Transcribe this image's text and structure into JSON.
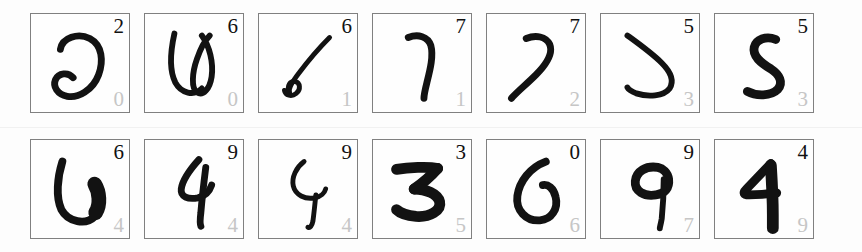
{
  "view": {
    "title": "Handwritten Digit Prediction Grid",
    "background_color": "#fdfdfd",
    "cell_border_color": "#808080",
    "predicted_label_color": "#111111",
    "true_label_color": "#c6c6c6",
    "stroke_color": "#121212",
    "rows": 2,
    "columns": 7,
    "cell_count": 14
  },
  "cells": [
    {
      "index": 0,
      "row": 1,
      "column": 1,
      "predicted": "2",
      "actual": "0",
      "shape": "two-open-loop"
    },
    {
      "index": 1,
      "row": 1,
      "column": 2,
      "predicted": "6",
      "actual": "0",
      "shape": "w-loop"
    },
    {
      "index": 2,
      "row": 1,
      "column": 3,
      "predicted": "6",
      "actual": "1",
      "shape": "slanted-stroke-loop"
    },
    {
      "index": 3,
      "row": 1,
      "column": 4,
      "predicted": "7",
      "actual": "1",
      "shape": "hooked-vertical"
    },
    {
      "index": 4,
      "row": 1,
      "column": 5,
      "predicted": "7",
      "actual": "2",
      "shape": "angled-seven"
    },
    {
      "index": 5,
      "row": 1,
      "column": 6,
      "predicted": "5",
      "actual": "3",
      "shape": "s-curve"
    },
    {
      "index": 6,
      "row": 1,
      "column": 7,
      "predicted": "5",
      "actual": "3",
      "shape": "bold-s"
    },
    {
      "index": 7,
      "row": 2,
      "column": 1,
      "predicted": "6",
      "actual": "4",
      "shape": "thick-u-loop"
    },
    {
      "index": 8,
      "row": 2,
      "column": 2,
      "predicted": "9",
      "actual": "4",
      "shape": "four-slant"
    },
    {
      "index": 9,
      "row": 2,
      "column": 3,
      "predicted": "9",
      "actual": "4",
      "shape": "y-shape"
    },
    {
      "index": 10,
      "row": 2,
      "column": 4,
      "predicted": "3",
      "actual": "5",
      "shape": "bold-three"
    },
    {
      "index": 11,
      "row": 2,
      "column": 5,
      "predicted": "0",
      "actual": "6",
      "shape": "open-circle"
    },
    {
      "index": 12,
      "row": 2,
      "column": 6,
      "predicted": "9",
      "actual": "7",
      "shape": "nine-tail"
    },
    {
      "index": 13,
      "row": 2,
      "column": 7,
      "predicted": "4",
      "actual": "9",
      "shape": "bold-four"
    }
  ]
}
